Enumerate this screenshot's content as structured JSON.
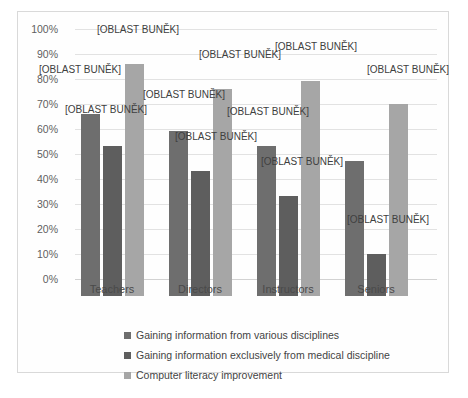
{
  "chart_data": {
    "type": "bar",
    "title": "",
    "subtitle": "",
    "xlabel": "",
    "ylabel": "",
    "ylim": [
      0,
      100
    ],
    "grid": true,
    "legend_position": "bottom",
    "categories": [
      "Teachers",
      "Directors",
      "Instructors",
      "Seniors"
    ],
    "ytick_labels": [
      "100%",
      "90%",
      "80%",
      "70%",
      "60%",
      "50%",
      "40%",
      "30%",
      "20%",
      "10%",
      "0%"
    ],
    "ytick_values": [
      100,
      90,
      80,
      70,
      60,
      50,
      40,
      30,
      20,
      10,
      0
    ],
    "series": [
      {
        "name": "Gaining information from various disciplines",
        "color": "#6e6e6e",
        "values": [
          73,
          66,
          60,
          54
        ]
      },
      {
        "name": "Gaining information exclusively from medical discipline",
        "color": "#5e5e5e",
        "values": [
          60,
          50,
          40,
          17
        ]
      },
      {
        "name": "Computer literacy improvement",
        "color": "#a6a6a6",
        "values": [
          93,
          83,
          86,
          77
        ]
      }
    ],
    "data_label_text": "[OBLAST BUNĚK]",
    "data_labels": [
      {
        "series": 0,
        "category": 0,
        "text": "[OBLAST BUNĚK]"
      },
      {
        "series": 1,
        "category": 0,
        "text": "[OBLAST BUNĚK]"
      },
      {
        "series": 2,
        "category": 0,
        "text": "[OBLAST BUNĚK]"
      },
      {
        "series": 0,
        "category": 1,
        "text": "[OBLAST BUNĚK]"
      },
      {
        "series": 1,
        "category": 1,
        "text": "[OBLAST BUNĚK]"
      },
      {
        "series": 2,
        "category": 1,
        "text": "[OBLAST BUNĚK]"
      },
      {
        "series": 0,
        "category": 2,
        "text": "[OBLAST BUNĚK]"
      },
      {
        "series": 1,
        "category": 2,
        "text": "[OBLAST BUNĚK]"
      },
      {
        "series": 2,
        "category": 2,
        "text": "[OBLAST BUNĚK]"
      },
      {
        "series": 1,
        "category": 3,
        "text": "[OBLAST BUNĚK]"
      },
      {
        "series": 2,
        "category": 3,
        "text": "[OBLAST BUNĚK]"
      }
    ]
  },
  "colors": {
    "series_1": "#6e6e6e",
    "series_2": "#5e5e5e",
    "series_3": "#a6a6a6",
    "gridline": "#e2e2e2",
    "border": "#d9d9d9",
    "axis_text": "#5f5f5f",
    "background": "#ffffff"
  }
}
